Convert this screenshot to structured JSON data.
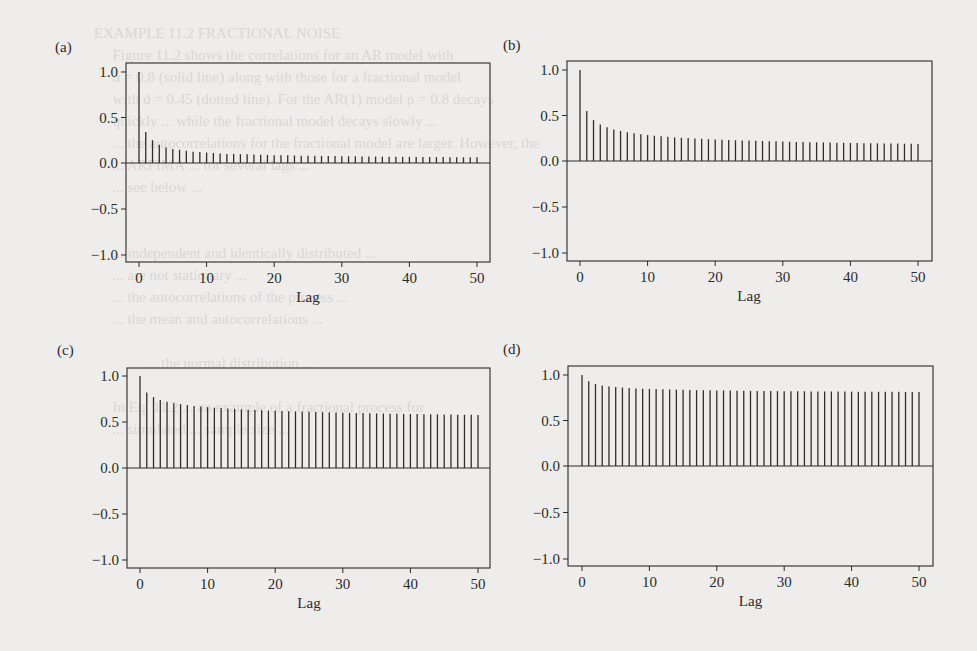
{
  "figure": {
    "panels": [
      {
        "id": "a",
        "label": "(a)"
      },
      {
        "id": "b",
        "label": "(b)"
      },
      {
        "id": "c",
        "label": "(c)"
      },
      {
        "id": "d",
        "label": "(d)"
      }
    ],
    "xlabel": "Lag",
    "yticks": [
      "1.0",
      "0.5",
      "0.0",
      "−0.5",
      "−1.0"
    ],
    "xticks": [
      "0",
      "10",
      "20",
      "30",
      "40",
      "50"
    ]
  },
  "chart_data": [
    {
      "type": "bar",
      "panel": "(a)",
      "title": "",
      "xlabel": "Lag",
      "ylabel": "",
      "ylim": [
        -1.0,
        1.0
      ],
      "xlim": [
        0,
        50
      ],
      "grid": false,
      "x": [
        0,
        1,
        2,
        3,
        4,
        5,
        6,
        7,
        8,
        9,
        10,
        11,
        12,
        13,
        14,
        15,
        16,
        17,
        18,
        19,
        20,
        21,
        22,
        23,
        24,
        25,
        26,
        27,
        28,
        29,
        30,
        31,
        32,
        33,
        34,
        35,
        36,
        37,
        38,
        39,
        40,
        41,
        42,
        43,
        44,
        45,
        46,
        47,
        48,
        49,
        50
      ],
      "values": [
        1.0,
        0.34,
        0.25,
        0.2,
        0.17,
        0.155,
        0.145,
        0.135,
        0.125,
        0.12,
        0.115,
        0.11,
        0.105,
        0.1,
        0.1,
        0.097,
        0.095,
        0.093,
        0.09,
        0.088,
        0.086,
        0.085,
        0.084,
        0.082,
        0.081,
        0.08,
        0.079,
        0.078,
        0.077,
        0.076,
        0.075,
        0.074,
        0.073,
        0.072,
        0.072,
        0.071,
        0.07,
        0.07,
        0.069,
        0.068,
        0.068,
        0.067,
        0.066,
        0.066,
        0.065,
        0.065,
        0.064,
        0.064,
        0.063,
        0.063,
        0.062
      ]
    },
    {
      "type": "bar",
      "panel": "(b)",
      "title": "",
      "xlabel": "Lag",
      "ylabel": "",
      "ylim": [
        -1.0,
        1.0
      ],
      "xlim": [
        0,
        50
      ],
      "grid": false,
      "x": [
        0,
        1,
        2,
        3,
        4,
        5,
        6,
        7,
        8,
        9,
        10,
        11,
        12,
        13,
        14,
        15,
        16,
        17,
        18,
        19,
        20,
        21,
        22,
        23,
        24,
        25,
        26,
        27,
        28,
        29,
        30,
        31,
        32,
        33,
        34,
        35,
        36,
        37,
        38,
        39,
        40,
        41,
        42,
        43,
        44,
        45,
        46,
        47,
        48,
        49,
        50
      ],
      "values": [
        1.0,
        0.55,
        0.45,
        0.4,
        0.37,
        0.345,
        0.33,
        0.315,
        0.305,
        0.295,
        0.285,
        0.278,
        0.272,
        0.266,
        0.26,
        0.256,
        0.252,
        0.248,
        0.244,
        0.24,
        0.237,
        0.234,
        0.231,
        0.228,
        0.226,
        0.224,
        0.222,
        0.22,
        0.218,
        0.216,
        0.214,
        0.212,
        0.21,
        0.209,
        0.207,
        0.206,
        0.204,
        0.203,
        0.201,
        0.2,
        0.199,
        0.198,
        0.196,
        0.195,
        0.194,
        0.193,
        0.192,
        0.191,
        0.19,
        0.189,
        0.188
      ]
    },
    {
      "type": "bar",
      "panel": "(c)",
      "title": "",
      "xlabel": "Lag",
      "ylabel": "",
      "ylim": [
        -1.0,
        1.0
      ],
      "xlim": [
        0,
        50
      ],
      "grid": false,
      "x": [
        0,
        1,
        2,
        3,
        4,
        5,
        6,
        7,
        8,
        9,
        10,
        11,
        12,
        13,
        14,
        15,
        16,
        17,
        18,
        19,
        20,
        21,
        22,
        23,
        24,
        25,
        26,
        27,
        28,
        29,
        30,
        31,
        32,
        33,
        34,
        35,
        36,
        37,
        38,
        39,
        40,
        41,
        42,
        43,
        44,
        45,
        46,
        47,
        48,
        49,
        50
      ],
      "values": [
        1.0,
        0.82,
        0.77,
        0.74,
        0.72,
        0.705,
        0.695,
        0.685,
        0.675,
        0.668,
        0.662,
        0.656,
        0.651,
        0.646,
        0.642,
        0.638,
        0.634,
        0.631,
        0.628,
        0.625,
        0.622,
        0.62,
        0.617,
        0.615,
        0.613,
        0.611,
        0.609,
        0.607,
        0.605,
        0.603,
        0.601,
        0.6,
        0.598,
        0.597,
        0.595,
        0.594,
        0.592,
        0.591,
        0.59,
        0.588,
        0.587,
        0.586,
        0.585,
        0.584,
        0.583,
        0.582,
        0.581,
        0.58,
        0.579,
        0.578,
        0.577
      ]
    },
    {
      "type": "bar",
      "panel": "(d)",
      "title": "",
      "xlabel": "Lag",
      "ylabel": "",
      "ylim": [
        -1.0,
        1.0
      ],
      "xlim": [
        0,
        50
      ],
      "grid": false,
      "x": [
        0,
        1,
        2,
        3,
        4,
        5,
        6,
        7,
        8,
        9,
        10,
        11,
        12,
        13,
        14,
        15,
        16,
        17,
        18,
        19,
        20,
        21,
        22,
        23,
        24,
        25,
        26,
        27,
        28,
        29,
        30,
        31,
        32,
        33,
        34,
        35,
        36,
        37,
        38,
        39,
        40,
        41,
        42,
        43,
        44,
        45,
        46,
        47,
        48,
        49,
        50
      ],
      "values": [
        1.0,
        0.93,
        0.9,
        0.885,
        0.875,
        0.868,
        0.862,
        0.857,
        0.853,
        0.85,
        0.847,
        0.845,
        0.843,
        0.841,
        0.839,
        0.837,
        0.836,
        0.834,
        0.833,
        0.832,
        0.831,
        0.83,
        0.829,
        0.828,
        0.827,
        0.826,
        0.825,
        0.825,
        0.824,
        0.823,
        0.822,
        0.822,
        0.821,
        0.821,
        0.82,
        0.82,
        0.819,
        0.819,
        0.818,
        0.818,
        0.817,
        0.817,
        0.816,
        0.816,
        0.816,
        0.815,
        0.815,
        0.815,
        0.814,
        0.814,
        0.814
      ]
    }
  ]
}
